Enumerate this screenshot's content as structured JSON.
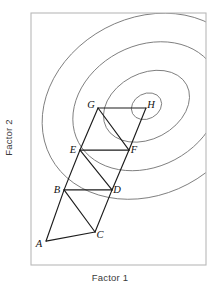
{
  "figure": {
    "type": "contour-simplex-plot",
    "axes": {
      "xlabel": "Factor 1",
      "ylabel": "Factor 2",
      "frame_color": "#b9b9b9",
      "ticks": [],
      "gridlines": false
    },
    "style": {
      "contour_color": "#6f6f6f",
      "simplex_color": "#1d1d1d",
      "label_color": "#111111",
      "background": "#ffffff"
    }
  },
  "chart_data": {
    "type": "line",
    "title": "",
    "subtitle": "",
    "xlabel": "Factor 1",
    "ylabel": "Factor 2",
    "xlim": [
      0,
      100
    ],
    "ylim": [
      0,
      100
    ],
    "grid": false,
    "legend": null,
    "vertices": [
      {
        "label": "A",
        "x": 8.6,
        "y": 9.5,
        "label_dx": -7,
        "label_dy": 4
      },
      {
        "label": "B",
        "x": 18.9,
        "y": 29.8,
        "label_dx": -7,
        "label_dy": 1
      },
      {
        "label": "C",
        "x": 36.6,
        "y": 13.1,
        "label_dx": 5,
        "label_dy": 4
      },
      {
        "label": "D",
        "x": 46.3,
        "y": 29.8,
        "label_dx": 5,
        "label_dy": 1
      },
      {
        "label": "E",
        "x": 28.0,
        "y": 45.6,
        "label_dx": -7,
        "label_dy": 1
      },
      {
        "label": "F",
        "x": 56.0,
        "y": 45.6,
        "label_dx": 5,
        "label_dy": 1
      },
      {
        "label": "G",
        "x": 38.3,
        "y": 62.3,
        "label_dx": -7,
        "label_dy": -2
      },
      {
        "label": "H",
        "x": 65.7,
        "y": 62.3,
        "label_dx": 5,
        "label_dy": -2
      }
    ],
    "simplex_edges": [
      [
        "A",
        "B"
      ],
      [
        "A",
        "C"
      ],
      [
        "B",
        "C"
      ],
      [
        "B",
        "D"
      ],
      [
        "C",
        "D"
      ],
      [
        "B",
        "E"
      ],
      [
        "D",
        "E"
      ],
      [
        "E",
        "F"
      ],
      [
        "D",
        "F"
      ],
      [
        "E",
        "G"
      ],
      [
        "F",
        "G"
      ],
      [
        "G",
        "H"
      ],
      [
        "F",
        "H"
      ]
    ],
    "contours": [
      {
        "level": 1,
        "cx": 66,
        "cy": 63,
        "rx": 62,
        "ry": 35,
        "rotation": -28
      },
      {
        "level": 2,
        "cx": 66,
        "cy": 63,
        "rx": 44,
        "ry": 24,
        "rotation": -28
      },
      {
        "level": 3,
        "cx": 66,
        "cy": 63,
        "rx": 26,
        "ry": 13,
        "rotation": -28
      },
      {
        "level": 4,
        "cx": 66,
        "cy": 63,
        "rx": 9,
        "ry": 5,
        "rotation": -28
      }
    ],
    "optimum": {
      "x": 66,
      "y": 63,
      "nearest_vertex": "H"
    }
  }
}
